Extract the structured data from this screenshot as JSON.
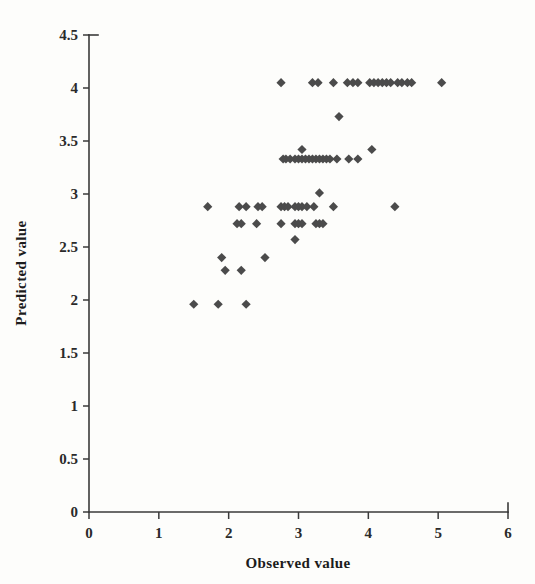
{
  "chart_data": {
    "type": "scatter",
    "title": "",
    "xlabel": "Observed value",
    "ylabel": "Predicted value",
    "xlim": [
      0,
      6
    ],
    "ylim": [
      0,
      4.5
    ],
    "xticks": [
      0,
      1,
      2,
      3,
      4,
      5,
      6
    ],
    "yticks": [
      0,
      0.5,
      1,
      1.5,
      2,
      2.5,
      3,
      3.5,
      4,
      4.5
    ],
    "xtick_labels": [
      "0",
      "1",
      "2",
      "3",
      "4",
      "5",
      "6"
    ],
    "ytick_labels": [
      "0",
      "0.5",
      "1",
      "1.5",
      "2",
      "2.5",
      "3",
      "3.5",
      "4",
      "4.5"
    ],
    "grid": false,
    "legend": false,
    "marker_shape": "diamond",
    "marker_color": "#4b4b4b",
    "series": [
      {
        "name": "Observed vs Predicted",
        "points": [
          [
            1.5,
            1.96
          ],
          [
            1.85,
            1.96
          ],
          [
            2.25,
            1.96
          ],
          [
            1.9,
            2.4
          ],
          [
            2.52,
            2.4
          ],
          [
            1.95,
            2.28
          ],
          [
            2.18,
            2.28
          ],
          [
            2.95,
            2.57
          ],
          [
            2.12,
            2.72
          ],
          [
            2.18,
            2.72
          ],
          [
            2.4,
            2.72
          ],
          [
            2.75,
            2.72
          ],
          [
            2.95,
            2.72
          ],
          [
            3.0,
            2.72
          ],
          [
            3.05,
            2.72
          ],
          [
            3.25,
            2.72
          ],
          [
            3.3,
            2.72
          ],
          [
            3.35,
            2.72
          ],
          [
            1.7,
            2.88
          ],
          [
            2.15,
            2.88
          ],
          [
            2.25,
            2.88
          ],
          [
            2.42,
            2.88
          ],
          [
            2.48,
            2.88
          ],
          [
            2.75,
            2.88
          ],
          [
            2.8,
            2.88
          ],
          [
            2.85,
            2.88
          ],
          [
            2.95,
            2.88
          ],
          [
            3.0,
            2.88
          ],
          [
            3.05,
            2.88
          ],
          [
            3.12,
            2.88
          ],
          [
            3.22,
            2.88
          ],
          [
            3.5,
            2.88
          ],
          [
            4.38,
            2.88
          ],
          [
            3.3,
            3.01
          ],
          [
            2.78,
            3.33
          ],
          [
            2.82,
            3.33
          ],
          [
            2.88,
            3.33
          ],
          [
            2.95,
            3.33
          ],
          [
            3.0,
            3.33
          ],
          [
            3.05,
            3.33
          ],
          [
            3.1,
            3.33
          ],
          [
            3.15,
            3.33
          ],
          [
            3.2,
            3.33
          ],
          [
            3.25,
            3.33
          ],
          [
            3.3,
            3.33
          ],
          [
            3.35,
            3.33
          ],
          [
            3.4,
            3.33
          ],
          [
            3.45,
            3.33
          ],
          [
            3.55,
            3.33
          ],
          [
            3.72,
            3.33
          ],
          [
            3.85,
            3.33
          ],
          [
            3.05,
            3.42
          ],
          [
            4.05,
            3.42
          ],
          [
            3.58,
            3.73
          ],
          [
            2.75,
            4.05
          ],
          [
            3.2,
            4.05
          ],
          [
            3.28,
            4.05
          ],
          [
            3.5,
            4.05
          ],
          [
            3.7,
            4.05
          ],
          [
            3.78,
            4.05
          ],
          [
            3.85,
            4.05
          ],
          [
            4.02,
            4.05
          ],
          [
            4.08,
            4.05
          ],
          [
            4.14,
            4.05
          ],
          [
            4.2,
            4.05
          ],
          [
            4.26,
            4.05
          ],
          [
            4.32,
            4.05
          ],
          [
            4.42,
            4.05
          ],
          [
            4.48,
            4.05
          ],
          [
            4.56,
            4.05
          ],
          [
            4.62,
            4.05
          ],
          [
            5.05,
            4.05
          ]
        ]
      }
    ]
  },
  "axes_geometry": {
    "plot_left_px": 89,
    "plot_right_px": 508,
    "plot_top_px": 35,
    "plot_bottom_px": 512
  }
}
